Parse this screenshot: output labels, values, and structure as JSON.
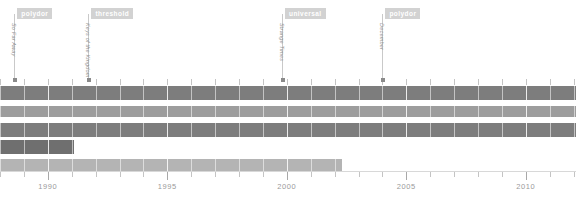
{
  "chart_data": {
    "type": "bar",
    "title": "",
    "xlabel": "",
    "ylabel": "",
    "orientation": "horizontal",
    "xlim": [
      1988.0,
      2012.1
    ],
    "grid": true,
    "legend": "none",
    "axis": {
      "major_ticks": [
        1990,
        1995,
        2000,
        2005,
        2010
      ],
      "major_tick_labels": [
        "1990",
        "1995",
        "2000",
        "2005",
        "2010"
      ],
      "minor_tick_step": 1,
      "minor_tick_start": 1988,
      "minor_tick_end": 2012
    },
    "bars": [
      {
        "name": "bar-1",
        "start": 1988.0,
        "end": 2012.1,
        "color": "#7d7d7d"
      },
      {
        "name": "bar-2",
        "start": 1988.0,
        "end": 2012.1,
        "color": "#9d9d9d"
      },
      {
        "name": "bar-3",
        "start": 1988.0,
        "end": 2012.1,
        "color": "#7d7d7d"
      },
      {
        "name": "bar-4",
        "start": 1988.0,
        "end": 1991.1,
        "color": "#6f6f6f"
      },
      {
        "name": "bar-5",
        "start": 1988.0,
        "end": 2002.3,
        "color": "#b4b4b4"
      }
    ],
    "events": [
      {
        "label": "polydor",
        "title": "So Far Away",
        "year": 1988.6
      },
      {
        "label": "threshold",
        "title": "Keys of the Kingdom",
        "year": 1991.7
      },
      {
        "label": "universal",
        "title": "Strange Times",
        "year": 1999.8
      },
      {
        "label": "polydor",
        "title": "December",
        "year": 2004.0
      }
    ]
  }
}
